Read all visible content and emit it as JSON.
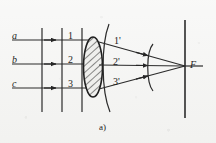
{
  "figure": {
    "caption": "a)",
    "colors": {
      "ink": "#1d1d1d",
      "line": "#2a2a2a",
      "background": "#f1f1ef",
      "hatch": "#3a3a3a"
    },
    "incident_rays": [
      {
        "id": "ray-a",
        "label": "a",
        "y": 40,
        "x_start": 12,
        "x_end": 92
      },
      {
        "id": "ray-b",
        "label": "b",
        "y": 64,
        "x_start": 12,
        "x_end": 92
      },
      {
        "id": "ray-c",
        "label": "c",
        "y": 88,
        "x_start": 12,
        "x_end": 92
      }
    ],
    "incident_wavefronts": [
      {
        "id": "wavefront-1",
        "label": "1",
        "x": 42
      },
      {
        "id": "wavefront-2",
        "label": "2",
        "x": 62
      },
      {
        "id": "wavefront-3",
        "label": "3",
        "x": 82
      }
    ],
    "wavefront_numbers": [
      {
        "label": "1",
        "x": 68,
        "y": 33
      },
      {
        "label": "2",
        "x": 68,
        "y": 57
      },
      {
        "label": "3",
        "x": 68,
        "y": 81
      }
    ],
    "refracted_rays": [
      {
        "id": "ray-1-prime",
        "label": "1'",
        "x": 113,
        "y": 37
      },
      {
        "id": "ray-2-prime",
        "label": "2'",
        "x": 113,
        "y": 58
      },
      {
        "id": "ray-3-prime",
        "label": "3'",
        "x": 113,
        "y": 78
      }
    ],
    "focal_point": {
      "label": "F",
      "x": 190,
      "y": 64
    },
    "lens": {
      "cx": 93,
      "cy": 67,
      "rx": 9,
      "ry": 30
    },
    "screen_line": {
      "x": 185,
      "y_top": 20,
      "y_bottom": 118
    }
  }
}
